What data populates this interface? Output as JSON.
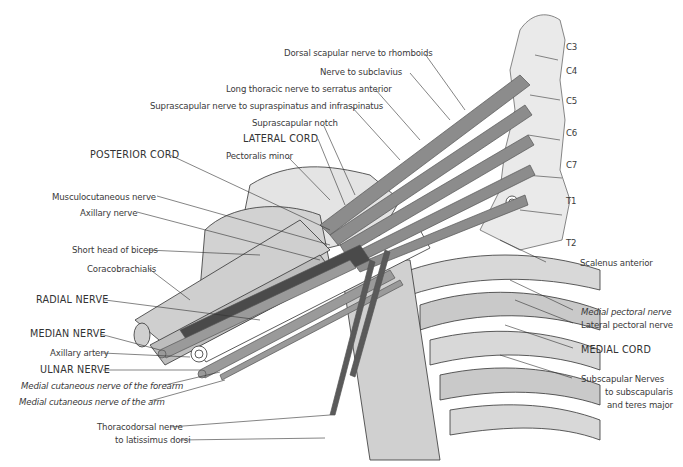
{
  "figure": {
    "vertebra_labels": [
      "C3",
      "C4",
      "C5",
      "C6",
      "C7",
      "T1",
      "T2"
    ],
    "top_labels": [
      "Dorsal scapular nerve to rhomboids",
      "Nerve to subclavius",
      "Long thoracic nerve to serratus anterior",
      "Suprascapular nerve to supraspinatus and infraspinatus",
      "Suprascapular notch",
      "LATERAL CORD",
      "Pectoralis minor"
    ],
    "left_labels": [
      "POSTERIOR CORD",
      "Musculocutaneous nerve",
      "Axillary nerve",
      "Short head of biceps",
      "Coracobrachialis",
      "RADIAL NERVE",
      "MEDIAN NERVE",
      "Axillary artery",
      "ULNAR NERVE",
      "Medial cutaneous nerve of the forearm",
      "Medial cutaneous nerve of the arm",
      "Thoracodorsal nerve",
      "to latissimus dorsi"
    ],
    "right_labels": [
      "Scalenus anterior",
      "Medial pectoral nerve",
      "Lateral pectoral nerve",
      "MEDIAL CORD",
      "Subscapular Nerves",
      "to subscapularis",
      "and teres major"
    ],
    "colors": {
      "nerve": "#8c8c8c",
      "nerve_dark": "#4a4a4a",
      "bone": "#d6d6d6",
      "muscle": "#c4c4c4",
      "outline": "#2a2a2a",
      "text": "#3a3a3a"
    }
  }
}
